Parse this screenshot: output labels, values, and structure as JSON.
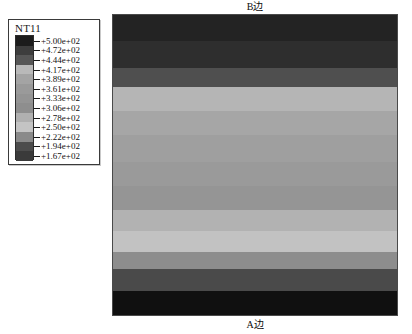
{
  "legend": {
    "title": "NT11",
    "ticks": [
      "+5.00e+02",
      "+4.72e+02",
      "+4.44e+02",
      "+4.17e+02",
      "+3.89e+02",
      "+3.61e+02",
      "+3.33e+02",
      "+3.06e+02",
      "+2.78e+02",
      "+2.50e+02",
      "+2.22e+02",
      "+1.94e+02",
      "+1.67e+02"
    ],
    "swatch_colors": [
      "#1c1c1c",
      "#3d3d3d",
      "#565656",
      "#b9b9b9",
      "#a4a4a4",
      "#9a9a9a",
      "#949494",
      "#8e8e8e",
      "#b0b0b0",
      "#c4c4c4",
      "#8a8a8a",
      "#4c4c4c",
      "#3a3a3a"
    ]
  },
  "plot": {
    "top_label": "B边",
    "bottom_label": "A边"
  },
  "chart_data": {
    "type": "heatmap",
    "title": "NT11",
    "xlabel": "",
    "ylabel": "",
    "orientation": "horizontal-bands",
    "legend_position": "left",
    "grid": false,
    "colormap": "grayscale",
    "variable": "NT11",
    "value_range": [
      166.7,
      500.0
    ],
    "contour_levels": [
      500.0,
      472.0,
      444.0,
      417.0,
      389.0,
      361.0,
      333.0,
      306.0,
      278.0,
      250.0,
      222.0,
      194.0,
      167.0
    ],
    "contour_level_labels": [
      "+5.00e+02",
      "+4.72e+02",
      "+4.44e+02",
      "+4.17e+02",
      "+3.89e+02",
      "+3.61e+02",
      "+3.33e+02",
      "+3.06e+02",
      "+2.78e+02",
      "+2.50e+02",
      "+2.22e+02",
      "+1.94e+02",
      "+1.67e+02"
    ],
    "bands": [
      {
        "y_frac_start": 0.0,
        "y_frac_end": 0.085,
        "value": 500.0,
        "color": "#232323"
      },
      {
        "y_frac_end": 0.175,
        "y_frac_start": 0.085,
        "value": 472.0,
        "color": "#2e2e2e"
      },
      {
        "y_frac_start": 0.175,
        "y_frac_end": 0.24,
        "value": 444.0,
        "color": "#4f4f4f"
      },
      {
        "y_frac_start": 0.24,
        "y_frac_end": 0.32,
        "value": 417.0,
        "color": "#b5b5b5"
      },
      {
        "y_frac_start": 0.32,
        "y_frac_end": 0.4,
        "value": 389.0,
        "color": "#a6a6a6"
      },
      {
        "y_frac_start": 0.4,
        "y_frac_end": 0.49,
        "value": 361.0,
        "color": "#9f9f9f"
      },
      {
        "y_frac_start": 0.49,
        "y_frac_end": 0.57,
        "value": 333.0,
        "color": "#9a9a9a"
      },
      {
        "y_frac_start": 0.57,
        "y_frac_end": 0.65,
        "value": 306.0,
        "color": "#959595"
      },
      {
        "y_frac_start": 0.65,
        "y_frac_end": 0.72,
        "value": 278.0,
        "color": "#b2b2b2"
      },
      {
        "y_frac_start": 0.72,
        "y_frac_end": 0.79,
        "value": 250.0,
        "color": "#c2c2c2"
      },
      {
        "y_frac_start": 0.79,
        "y_frac_end": 0.845,
        "value": 222.0,
        "color": "#8d8d8d"
      },
      {
        "y_frac_start": 0.845,
        "y_frac_end": 0.92,
        "value": 194.0,
        "color": "#4a4a4a"
      },
      {
        "y_frac_start": 0.92,
        "y_frac_end": 1.0,
        "value": 167.0,
        "color": "#101010"
      }
    ],
    "annotations": [
      "B边",
      "A边"
    ]
  }
}
